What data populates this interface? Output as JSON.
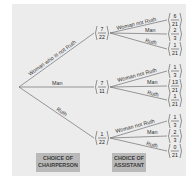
{
  "diagram": {
    "type": "probability-tree",
    "root": {
      "branches": [
        {
          "label": "Woman who is not Ruth",
          "probability": "7/22",
          "num": "7",
          "den": "22",
          "children": [
            {
              "label": "Woman not Ruth",
              "num": "6",
              "den": "21"
            },
            {
              "label": "Man",
              "num": "2",
              "den": "3"
            },
            {
              "label": "Ruth",
              "num": "1",
              "den": "21"
            }
          ]
        },
        {
          "label": "Man",
          "probability": "7/11",
          "num": "7",
          "den": "11",
          "children": [
            {
              "label": "Woman not Ruth",
              "num": "1",
              "den": "3"
            },
            {
              "label": "Man",
              "num": "13",
              "den": "21"
            },
            {
              "label": "Ruth",
              "num": "1",
              "den": "21"
            }
          ]
        },
        {
          "label": "Ruth",
          "probability": "1/22",
          "num": "1",
          "den": "22",
          "children": [
            {
              "label": "Woman not Ruth",
              "num": "1",
              "den": "3"
            },
            {
              "label": "Man",
              "num": "2",
              "den": "3"
            },
            {
              "label": "Ruth",
              "num": "0",
              "den": "21"
            }
          ]
        }
      ]
    },
    "stage_labels": {
      "first_line1": "CHOICE OF",
      "first_line2": "CHAIRPERSON",
      "second_line1": "CHOICE OF",
      "second_line2": "ASSISTANT"
    },
    "colors": {
      "background": "#ececec",
      "line": "#666666",
      "label_box": "#b9b9b9"
    }
  }
}
